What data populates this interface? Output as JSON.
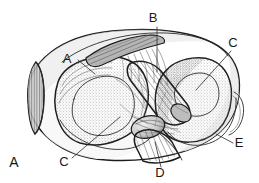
{
  "figure": {
    "panel_label": "A",
    "background_color": "#ffffff",
    "ink_color": "#1c1c1c",
    "label_color": "#1a1a1a"
  },
  "callouts": [
    {
      "id": "callout-a",
      "letter": "A",
      "text_x": 67,
      "text_y": 63,
      "line": {
        "x1": 78,
        "y1": 60,
        "x2": 95,
        "y2": 74
      }
    },
    {
      "id": "callout-b",
      "letter": "B",
      "text_x": 153,
      "text_y": 22,
      "line": {
        "x1": 157,
        "y1": 27,
        "x2": 157,
        "y2": 72
      }
    },
    {
      "id": "callout-c1",
      "letter": "C",
      "text_x": 233,
      "text_y": 47,
      "line": {
        "x1": 231,
        "y1": 51,
        "x2": 196,
        "y2": 90
      }
    },
    {
      "id": "callout-c2",
      "letter": "C",
      "text_x": 64,
      "text_y": 166,
      "line": {
        "x1": 72,
        "y1": 158,
        "x2": 120,
        "y2": 117
      }
    },
    {
      "id": "callout-d",
      "letter": "D",
      "text_x": 160,
      "text_y": 175,
      "line": {
        "x1": 161,
        "y1": 167,
        "x2": 155,
        "y2": 142
      }
    },
    {
      "id": "callout-e",
      "letter": "E",
      "text_x": 236,
      "text_y": 147,
      "line": {
        "x1": 233,
        "y1": 143,
        "x2": 216,
        "y2": 134
      }
    }
  ],
  "shading": {
    "meniscus_fill": "#d8d8d8",
    "condyle_fill": "#f0f0f0",
    "ligament_fill": "#cfcfcf",
    "rim_fill": "#b9b9b9",
    "stipple_color": "#6e6e6e"
  }
}
